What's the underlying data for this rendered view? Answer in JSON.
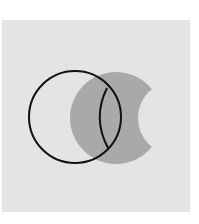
{
  "diagram": {
    "type": "venn",
    "background_color": "#ffffff",
    "panel_color": "#e4e4e4",
    "shade_color": "#a9a9a9",
    "outline_color": "#111111",
    "circles": [
      {
        "id": "A",
        "label": "",
        "cx": 75,
        "cy": 117,
        "r": 46,
        "style": "outline"
      },
      {
        "id": "B",
        "label": "",
        "cx": 116,
        "cy": 118,
        "r": 46,
        "style": "shaded"
      }
    ],
    "cutout": {
      "cx": 175,
      "cy": 118,
      "r": 37
    },
    "lens_arc": {
      "from": [
        107,
        88
      ],
      "to": [
        108,
        148
      ],
      "bulge_x": 97
    }
  }
}
